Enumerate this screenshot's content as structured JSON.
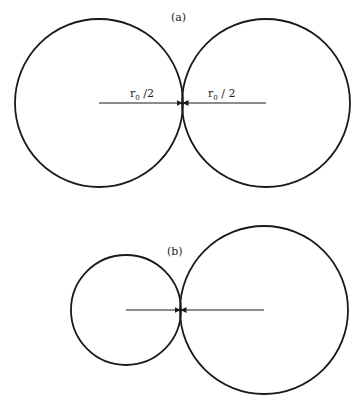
{
  "figure": {
    "panel_a": {
      "label": "(a)",
      "left_circle": {
        "cx": 99,
        "cy": 103,
        "r": 84
      },
      "right_circle": {
        "cx": 266,
        "cy": 103,
        "r": 84
      },
      "left_radius_label": {
        "base": "r",
        "subscript": "0",
        "suffix": " /2"
      },
      "right_radius_label": {
        "base": "r",
        "subscript": "0",
        "suffix": " / 2"
      }
    },
    "panel_b": {
      "label": "(b)",
      "small_circle": {
        "cx": 126,
        "cy": 310,
        "r": 55
      },
      "large_circle": {
        "cx": 264,
        "cy": 310,
        "r": 84
      }
    },
    "colors": {
      "stroke": "#1a1a1a",
      "background": "#ffffff"
    }
  }
}
